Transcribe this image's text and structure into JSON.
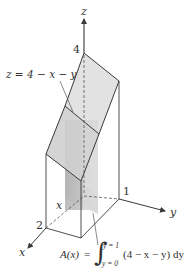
{
  "figure": {
    "type": "3d-solid-cross-section",
    "axes": {
      "z_label": "z",
      "y_label": "y",
      "x_label": "x"
    },
    "ticks": {
      "z_tick": "4",
      "y_tick": "1",
      "x_tick": "2"
    },
    "surface_label": "z = 4 − x − y",
    "slice_label": "x",
    "formula": {
      "lhs": "A(x)",
      "equals": "=",
      "integral_sign": "∫",
      "upper_limit": "y = 1",
      "lower_limit": "y = 0",
      "integrand": "(4 − x − y) dy"
    },
    "colors": {
      "line": "#3a3a3a",
      "surface_fill": "#d9d9d9",
      "surface_fill_light": "#e6e6e6",
      "cross_section_dark": "#b8b8b8",
      "cross_section_light": "#d0d0d0",
      "background": "#ffffff"
    }
  }
}
